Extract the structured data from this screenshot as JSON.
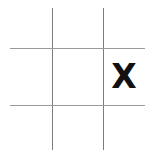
{
  "board": {
    "title": "tic-tac-toe-board",
    "rows": 3,
    "columns": 3,
    "background_color": "#ffffff",
    "line_color": "#8f8f8f",
    "mark_color": "#111111",
    "cells": [
      {
        "id": "cell-r1c1",
        "row": 1,
        "column": 1,
        "mark": ""
      },
      {
        "id": "cell-r1c2",
        "row": 1,
        "column": 2,
        "mark": ""
      },
      {
        "id": "cell-r1c3",
        "row": 1,
        "column": 3,
        "mark": ""
      },
      {
        "id": "cell-r2c1",
        "row": 2,
        "column": 1,
        "mark": ""
      },
      {
        "id": "cell-r2c2",
        "row": 2,
        "column": 2,
        "mark": ""
      },
      {
        "id": "cell-r2c3",
        "row": 2,
        "column": 3,
        "mark": "X"
      },
      {
        "id": "cell-r3c1",
        "row": 3,
        "column": 1,
        "mark": ""
      },
      {
        "id": "cell-r3c2",
        "row": 3,
        "column": 2,
        "mark": ""
      },
      {
        "id": "cell-r3c3",
        "row": 3,
        "column": 3,
        "mark": ""
      }
    ]
  }
}
